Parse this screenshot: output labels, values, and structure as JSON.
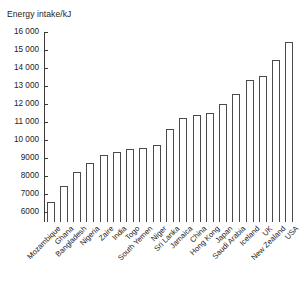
{
  "chart_data": {
    "type": "bar",
    "title": "Energy intake/kJ",
    "xlabel": "",
    "ylabel": "Energy intake/kJ",
    "ylim": [
      5444,
      16000
    ],
    "grid": false,
    "legend": null,
    "ytick_labels": [
      "16 000",
      "15 000",
      "14 000",
      "13 000",
      "12 000",
      "11 000",
      "10 000",
      "9000",
      "8000",
      "7000",
      "6000"
    ],
    "ytick_values": [
      16000,
      15000,
      14000,
      13000,
      12000,
      11000,
      10000,
      9000,
      8000,
      7000,
      6000
    ],
    "categories": [
      "Mozambique",
      "Ghana",
      "Bangladesh",
      "Nigeria",
      "Zaire",
      "India",
      "Togo",
      "South Yemen",
      "Niger",
      "Sri Lanka",
      "Jamaica",
      "China",
      "Hong Kong",
      "Japan",
      "Saudi Arabia",
      "Iceland",
      "UK",
      "New Zealand",
      "USA"
    ],
    "values": [
      6550,
      7420,
      8250,
      8720,
      9160,
      9350,
      9500,
      9550,
      9700,
      10600,
      11200,
      11400,
      11500,
      12000,
      12550,
      13350,
      13550,
      14450,
      15450
    ],
    "bar_facecolor": "#ffffff",
    "bar_edgecolor": "#4a4a4a",
    "axis_color": "#3a3a3a"
  }
}
